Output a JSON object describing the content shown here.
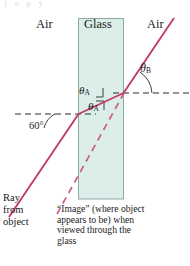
{
  "figure": {
    "type": "optics-refraction-diagram",
    "title_fragment_top": ") o   p        y",
    "regions": [
      {
        "name": "air-left",
        "label": "Air",
        "x": 44,
        "y": 24
      },
      {
        "name": "glass-slab",
        "label": "Glass",
        "x": 101,
        "y": 24
      },
      {
        "name": "air-right",
        "label": "Air",
        "x": 157,
        "y": 24
      }
    ],
    "angles": [
      {
        "name": "theta-a-incident",
        "symbol": "θ",
        "subscript": "A",
        "x": 82,
        "y": 89
      },
      {
        "name": "theta-a-inside",
        "symbol": "θ",
        "subscript": "A",
        "x": 90,
        "y": 104
      },
      {
        "name": "theta-b",
        "symbol": "θ",
        "subscript": "B",
        "x": 143,
        "y": 67
      },
      {
        "name": "sixty-degrees",
        "text": "60°",
        "x": 31,
        "y": 121
      }
    ],
    "annotations": {
      "ray_label": {
        "name": "ray-from-object",
        "lines": [
          "Ray",
          "from",
          "object"
        ],
        "x": 3,
        "y": 195
      },
      "image_caption": {
        "name": "image-caption",
        "lines": [
          "“Image” (where object",
          "appears to be) when",
          "viewed through the",
          "glass"
        ],
        "x": 57,
        "y": 206
      }
    },
    "colors": {
      "ray": "#c23a69",
      "ray_dashed": "#cf5c86",
      "glass_fill": "#dceee9",
      "glass_stroke": "#8aa6a4",
      "normal_dash": "#2b2b2b",
      "text": "#1a1a1a",
      "background": "#ffffff"
    },
    "geometry": {
      "glass": {
        "x": 78,
        "y": 18,
        "width": 46,
        "height": 181
      },
      "normal_left": {
        "x1": 15,
        "y1": 114,
        "x2": 96,
        "y2": 114
      },
      "normal_right": {
        "x1": 114,
        "y1": 93,
        "x2": 188,
        "y2": 93
      },
      "ray_incoming": {
        "x1": 10,
        "y1": 216,
        "x2": 78,
        "y2": 114
      },
      "ray_inside": {
        "x1": 78,
        "y1": 114,
        "x2": 124,
        "y2": 93
      },
      "ray_outgoing": {
        "x1": 124,
        "y1": 93,
        "x2": 173,
        "y2": 19
      },
      "ray_virtual": {
        "x1": 57,
        "y1": 213,
        "x2": 124,
        "y2": 93
      }
    }
  }
}
